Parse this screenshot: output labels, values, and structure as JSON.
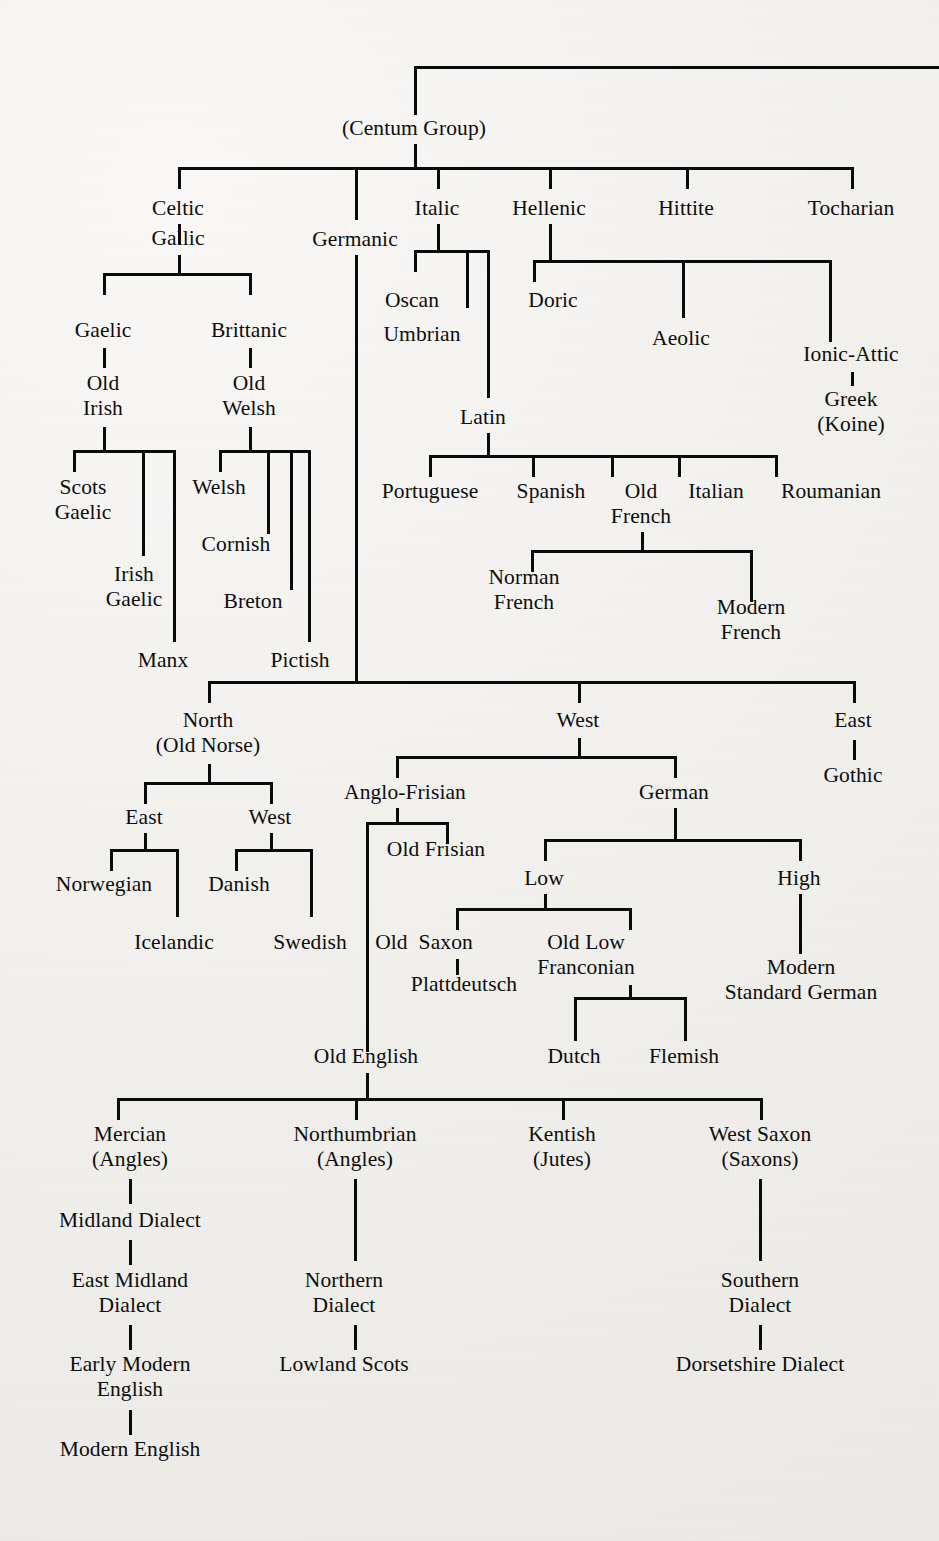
{
  "diagram": {
    "line_color": "#0a0a0a",
    "background_color": "#f2f1ef",
    "text_color": "#0d0d0d"
  },
  "nodes": {
    "centum_group": "(Centum Group)",
    "celtic": "Celtic",
    "gallic": "Gallic",
    "gaelic": "Gaelic",
    "brittanic": "Brittanic",
    "old_irish": "Old\nIrish",
    "old_welsh": "Old\nWelsh",
    "scots_gaelic": "Scots\nGaelic",
    "irish_gaelic": "Irish\nGaelic",
    "manx": "Manx",
    "welsh": "Welsh",
    "cornish": "Cornish",
    "breton": "Breton",
    "pictish": "Pictish",
    "germanic": "Germanic",
    "italic": "Italic",
    "hellenic": "Hellenic",
    "hittite": "Hittite",
    "tocharian": "Tocharian",
    "oscan": "Oscan",
    "umbrian": "Umbrian",
    "latin": "Latin",
    "doric": "Doric",
    "aeolic": "Aeolic",
    "ionic_attic": "Ionic-Attic",
    "greek_koine": "Greek\n(Koine)",
    "portuguese": "Portuguese",
    "spanish": "Spanish",
    "old_french": "Old\nFrench",
    "italian": "Italian",
    "roumanian": "Roumanian",
    "norman_french": "Norman\nFrench",
    "modern_french": "Modern\nFrench",
    "north_old_norse": "North\n(Old Norse)",
    "west": "West",
    "east": "East",
    "gothic": "Gothic",
    "norse_east": "East",
    "norse_west": "West",
    "norwegian": "Norwegian",
    "icelandic": "Icelandic",
    "danish": "Danish",
    "swedish": "Swedish",
    "anglo_frisian": "Anglo-Frisian",
    "german": "German",
    "old_frisian": "Old Frisian",
    "low": "Low",
    "high": "High",
    "old_saxon": "Old  Saxon",
    "old_low_franconian": "Old Low\nFranconian",
    "plattdeutsch": "Plattdeutsch",
    "modern_standard_german": "Modern\nStandard German",
    "dutch": "Dutch",
    "flemish": "Flemish",
    "old_english": "Old English",
    "mercian": "Mercian\n(Angles)",
    "northumbrian": "Northumbrian\n(Angles)",
    "kentish": "Kentish\n(Jutes)",
    "west_saxon": "West Saxon\n(Saxons)",
    "midland_dialect": "Midland Dialect",
    "east_midland_dialect": "East Midland\nDialect",
    "early_modern_english": "Early Modern\nEnglish",
    "modern_english": "Modern English",
    "northern_dialect": "Northern\nDialect",
    "lowland_scots": "Lowland Scots",
    "southern_dialect": "Southern\nDialect",
    "dorsetshire_dialect": "Dorsetshire Dialect"
  },
  "tree_data": {
    "type": "tree",
    "root": "(Centum Group)",
    "edges": [
      [
        "(Centum Group)",
        "Celtic"
      ],
      [
        "(Centum Group)",
        "Germanic"
      ],
      [
        "(Centum Group)",
        "Italic"
      ],
      [
        "(Centum Group)",
        "Hellenic"
      ],
      [
        "(Centum Group)",
        "Hittite"
      ],
      [
        "(Centum Group)",
        "Tocharian"
      ],
      [
        "Celtic",
        "Gallic"
      ],
      [
        "Gallic",
        "Gaelic"
      ],
      [
        "Gallic",
        "Brittanic"
      ],
      [
        "Gaelic",
        "Old Irish"
      ],
      [
        "Brittanic",
        "Old Welsh"
      ],
      [
        "Old Irish",
        "Scots Gaelic"
      ],
      [
        "Old Irish",
        "Irish Gaelic"
      ],
      [
        "Old Irish",
        "Manx"
      ],
      [
        "Old Welsh",
        "Welsh"
      ],
      [
        "Old Welsh",
        "Cornish"
      ],
      [
        "Old Welsh",
        "Breton"
      ],
      [
        "Old Welsh",
        "Pictish"
      ],
      [
        "Italic",
        "Oscan"
      ],
      [
        "Italic",
        "Umbrian"
      ],
      [
        "Italic",
        "Latin"
      ],
      [
        "Latin",
        "Portuguese"
      ],
      [
        "Latin",
        "Spanish"
      ],
      [
        "Latin",
        "Old French"
      ],
      [
        "Latin",
        "Italian"
      ],
      [
        "Latin",
        "Roumanian"
      ],
      [
        "Old French",
        "Norman French"
      ],
      [
        "Old French",
        "Modern French"
      ],
      [
        "Hellenic",
        "Doric"
      ],
      [
        "Hellenic",
        "Aeolic"
      ],
      [
        "Hellenic",
        "Ionic-Attic"
      ],
      [
        "Ionic-Attic",
        "Greek (Koine)"
      ],
      [
        "Germanic",
        "North (Old Norse)"
      ],
      [
        "Germanic",
        "West"
      ],
      [
        "Germanic",
        "East"
      ],
      [
        "East",
        "Gothic"
      ],
      [
        "North (Old Norse)",
        "East"
      ],
      [
        "North (Old Norse)",
        "West"
      ],
      [
        "East",
        "Norwegian"
      ],
      [
        "East",
        "Icelandic"
      ],
      [
        "West",
        "Danish"
      ],
      [
        "West",
        "Swedish"
      ],
      [
        "West",
        "Anglo-Frisian"
      ],
      [
        "West",
        "German"
      ],
      [
        "Anglo-Frisian",
        "Old Frisian"
      ],
      [
        "Anglo-Frisian",
        "Old English"
      ],
      [
        "German",
        "Low"
      ],
      [
        "German",
        "High"
      ],
      [
        "Low",
        "Old  Saxon"
      ],
      [
        "Low",
        "Old Low Franconian"
      ],
      [
        "Old  Saxon",
        "Plattdeutsch"
      ],
      [
        "Old Low Franconian",
        "Dutch"
      ],
      [
        "Old Low Franconian",
        "Flemish"
      ],
      [
        "High",
        "Modern Standard German"
      ],
      [
        "Old English",
        "Mercian (Angles)"
      ],
      [
        "Old English",
        "Northumbrian (Angles)"
      ],
      [
        "Old English",
        "Kentish (Jutes)"
      ],
      [
        "Old English",
        "West Saxon (Saxons)"
      ],
      [
        "Mercian (Angles)",
        "Midland Dialect"
      ],
      [
        "Midland Dialect",
        "East Midland Dialect"
      ],
      [
        "East Midland Dialect",
        "Early Modern English"
      ],
      [
        "Early Modern English",
        "Modern English"
      ],
      [
        "Northumbrian (Angles)",
        "Northern Dialect"
      ],
      [
        "Northern Dialect",
        "Lowland Scots"
      ],
      [
        "West Saxon (Saxons)",
        "Southern Dialect"
      ],
      [
        "Southern Dialect",
        "Dorsetshire Dialect"
      ]
    ]
  }
}
